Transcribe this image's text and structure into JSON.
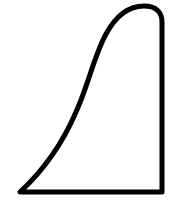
{
  "figure": {
    "stroke_color": "#000000",
    "fill_color": "#ffffff",
    "stroke_width": 5
  }
}
